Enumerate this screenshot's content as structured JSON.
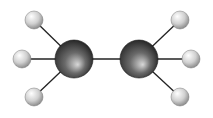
{
  "molecule": {
    "name": "ethane",
    "colors": {
      "bond": "#222222",
      "carbon_light": "#cfcfcf",
      "carbon_dark": "#2a2a2a",
      "hydrogen_light": "#fafafa",
      "hydrogen_dark": "#9a9a9a"
    },
    "atoms": [
      {
        "id": "C1",
        "element": "C",
        "x": 74,
        "y": 59,
        "r": 19
      },
      {
        "id": "C2",
        "element": "C",
        "x": 139,
        "y": 59,
        "r": 19
      },
      {
        "id": "H1",
        "element": "H",
        "x": 34,
        "y": 20,
        "r": 9
      },
      {
        "id": "H2",
        "element": "H",
        "x": 22,
        "y": 59,
        "r": 9
      },
      {
        "id": "H3",
        "element": "H",
        "x": 34,
        "y": 97,
        "r": 9
      },
      {
        "id": "H4",
        "element": "H",
        "x": 180,
        "y": 20,
        "r": 9
      },
      {
        "id": "H5",
        "element": "H",
        "x": 191,
        "y": 59,
        "r": 9
      },
      {
        "id": "H6",
        "element": "H",
        "x": 180,
        "y": 97,
        "r": 9
      }
    ],
    "bonds": [
      [
        "C1",
        "C2"
      ],
      [
        "C1",
        "H1"
      ],
      [
        "C1",
        "H2"
      ],
      [
        "C1",
        "H3"
      ],
      [
        "C2",
        "H4"
      ],
      [
        "C2",
        "H5"
      ],
      [
        "C2",
        "H6"
      ]
    ]
  }
}
